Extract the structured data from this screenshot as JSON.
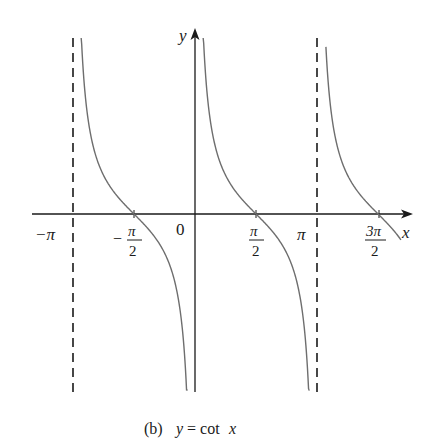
{
  "chart_data": {
    "type": "line",
    "title": "(b) y = cot x",
    "caption_prefix": "(b)",
    "caption_formula": "y = cot x",
    "function": "cot(x)",
    "xlabel": "x",
    "ylabel": "y",
    "x_ticks": [
      {
        "value": -3.14159,
        "label": "−π"
      },
      {
        "value": -1.5708,
        "label_num": "π",
        "label_den": "2",
        "sign": "−"
      },
      {
        "value": 0,
        "label": "0"
      },
      {
        "value": 1.5708,
        "label_num": "π",
        "label_den": "2",
        "sign": ""
      },
      {
        "value": 3.14159,
        "label": "π"
      },
      {
        "value": 4.71239,
        "label_num": "3π",
        "label_den": "2",
        "sign": ""
      }
    ],
    "asymptotes": [
      -3.14159,
      3.14159
    ],
    "asymptote_style": "dashed",
    "xlim": [
      -4.2,
      5.6
    ],
    "ylim": [
      -4.5,
      4.6
    ],
    "grid": false,
    "legend": null,
    "series": [
      {
        "name": "branch (-π, 0)",
        "x_range": [
          -2.93,
          -0.19
        ],
        "zeros": [
          -1.5708
        ]
      },
      {
        "name": "branch (0, π)",
        "x_range": [
          0.21,
          2.95
        ],
        "zeros": [
          1.5708
        ]
      },
      {
        "name": "branch (π, 2π) partial",
        "x_range": [
          3.37,
          5.3
        ],
        "zeros": [
          4.71239
        ]
      }
    ],
    "colors": {
      "curve": "#6e6e6e",
      "axis": "#1a1a1a",
      "asymptote": "#1a1a1a"
    }
  }
}
